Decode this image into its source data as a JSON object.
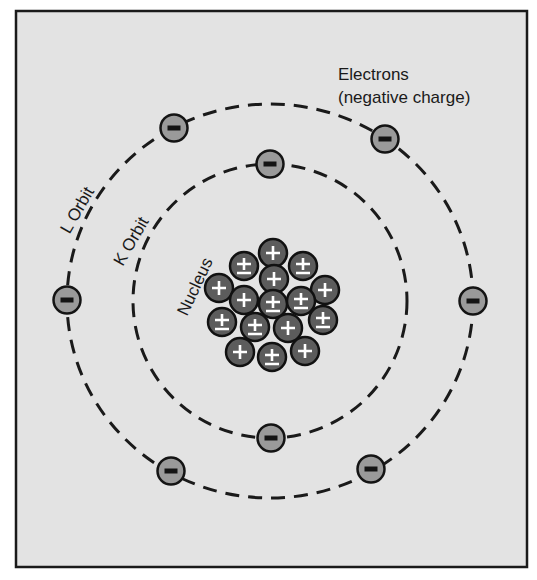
{
  "diagram": {
    "labels": {
      "electrons_line1": "Electrons",
      "electrons_line2": "(negative charge)",
      "l_orbit": "L Orbit",
      "k_orbit": "K Orbit",
      "nucleus": "Nucleus"
    },
    "colors": {
      "background": "#e3e3e3",
      "frame_border": "#1a1a1a",
      "electron_fill": "#9a9a9a",
      "particle_fill": "#5c5c5c",
      "particle_symbol": "#ffffff"
    },
    "orbits": [
      {
        "name": "K",
        "cx": 270,
        "cy": 301,
        "rx": 137,
        "ry": 137
      },
      {
        "name": "L",
        "cx": 270,
        "cy": 301,
        "rx": 203,
        "ry": 197
      }
    ],
    "electrons": [
      {
        "orbit": "K",
        "x": 270,
        "y": 164,
        "charge": "-"
      },
      {
        "orbit": "K",
        "x": 271,
        "y": 438,
        "charge": "-"
      },
      {
        "orbit": "L",
        "x": 174,
        "y": 128,
        "charge": "-"
      },
      {
        "orbit": "L",
        "x": 385,
        "y": 139,
        "charge": "-"
      },
      {
        "orbit": "L",
        "x": 67,
        "y": 300,
        "charge": "-"
      },
      {
        "orbit": "L",
        "x": 473,
        "y": 301,
        "charge": "-"
      },
      {
        "orbit": "L",
        "x": 171,
        "y": 471,
        "charge": "-"
      },
      {
        "orbit": "L",
        "x": 371,
        "y": 469,
        "charge": "-"
      }
    ],
    "nucleus_particles": [
      {
        "x": 273,
        "y": 253,
        "type": "proton",
        "symbol": "+"
      },
      {
        "x": 244,
        "y": 266,
        "type": "neutron",
        "symbol": "±"
      },
      {
        "x": 303,
        "y": 266,
        "type": "neutron",
        "symbol": "±"
      },
      {
        "x": 274,
        "y": 279,
        "type": "proton",
        "symbol": "+"
      },
      {
        "x": 219,
        "y": 288,
        "type": "proton",
        "symbol": "+"
      },
      {
        "x": 325,
        "y": 290,
        "type": "proton",
        "symbol": "+"
      },
      {
        "x": 244,
        "y": 300,
        "type": "proton",
        "symbol": "+"
      },
      {
        "x": 273,
        "y": 304,
        "type": "neutron",
        "symbol": "±"
      },
      {
        "x": 301,
        "y": 301,
        "type": "neutron",
        "symbol": "±"
      },
      {
        "x": 222,
        "y": 322,
        "type": "neutron",
        "symbol": "±"
      },
      {
        "x": 255,
        "y": 327,
        "type": "neutron",
        "symbol": "±"
      },
      {
        "x": 288,
        "y": 328,
        "type": "proton",
        "symbol": "+"
      },
      {
        "x": 323,
        "y": 320,
        "type": "neutron",
        "symbol": "±"
      },
      {
        "x": 240,
        "y": 352,
        "type": "proton",
        "symbol": "+"
      },
      {
        "x": 272,
        "y": 357,
        "type": "neutron",
        "symbol": "±"
      },
      {
        "x": 305,
        "y": 351,
        "type": "proton",
        "symbol": "+"
      }
    ],
    "counts": {
      "protons": 8,
      "neutrons": 8,
      "electrons": 8
    }
  }
}
